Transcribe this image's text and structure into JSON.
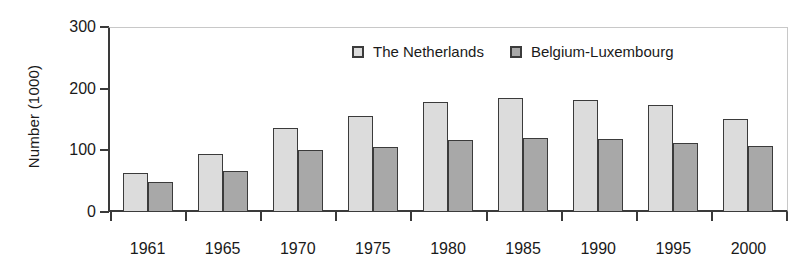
{
  "chart_data": {
    "type": "bar",
    "title": "",
    "xlabel": "",
    "ylabel": "Number (1000)",
    "categories": [
      "1961",
      "1965",
      "1970",
      "1975",
      "1980",
      "1985",
      "1990",
      "1995",
      "2000"
    ],
    "series": [
      {
        "name": "The Netherlands",
        "color": "#dcdcdc",
        "values": [
          63,
          94,
          136,
          156,
          179,
          185,
          182,
          173,
          151
        ]
      },
      {
        "name": "Belgium-Luxembourg",
        "color": "#a8a8a8",
        "values": [
          49,
          67,
          100,
          106,
          117,
          120,
          118,
          112,
          107
        ]
      }
    ],
    "ylim": [
      0,
      300
    ],
    "yticks": [
      0,
      100,
      200,
      300
    ],
    "ytick_labels": [
      "0",
      "100",
      "200",
      "300"
    ],
    "grid": false,
    "legend_position": "top-center"
  },
  "legend": {
    "items": [
      {
        "label": "The Netherlands"
      },
      {
        "label": "Belgium-Luxembourg"
      }
    ]
  }
}
